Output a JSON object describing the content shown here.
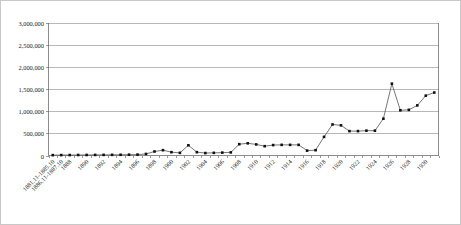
{
  "chart_data": {
    "type": "line",
    "title": "",
    "subtitle": "",
    "xlabel": "",
    "ylabel": "",
    "ylim": [
      0,
      3000000
    ],
    "ytick_labels": [
      "3,000,000",
      "2,500,000",
      "2,000,000",
      "1,500,000",
      "1,000,000",
      "500,000",
      "0"
    ],
    "ytick_values": [
      3000000,
      2500000,
      2000000,
      1500000,
      1000000,
      500000,
      0
    ],
    "grid": "horizontal",
    "legend": "none",
    "markers": "filled-square",
    "categories": [
      "1881.11-1885.10",
      "1886.11-1887.10",
      "1888",
      "1889",
      "1890",
      "1891",
      "1892",
      "1893",
      "1894",
      "1895",
      "1896",
      "1897",
      "1898",
      "1899",
      "1900",
      "1901",
      "1902",
      "1903",
      "1904",
      "1905",
      "1906",
      "1907",
      "1908",
      "1909",
      "1910",
      "1911",
      "1912",
      "1913",
      "1914",
      "1915",
      "1916",
      "1917",
      "1918",
      "1919",
      "1920",
      "1921",
      "1922",
      "1923",
      "1924",
      "1925",
      "1926",
      "1927",
      "1928",
      "1929",
      "1930",
      "1931"
    ],
    "xtick_labels_shown": [
      "1881.11-1885.10",
      "1886.11-1887.10",
      "1888",
      "1890",
      "1892",
      "1894",
      "1896",
      "1898",
      "1900",
      "1902",
      "1904",
      "1906",
      "1908",
      "1910",
      "1912",
      "1914",
      "1916",
      "1918",
      "1920",
      "1922",
      "1924",
      "1926",
      "1928",
      "1930"
    ],
    "values": [
      8000,
      9000,
      10000,
      11000,
      12000,
      13000,
      14000,
      15000,
      16000,
      18000,
      20000,
      35000,
      90000,
      120000,
      75000,
      60000,
      230000,
      75000,
      55000,
      60000,
      65000,
      70000,
      255000,
      275000,
      250000,
      210000,
      235000,
      240000,
      240000,
      240000,
      110000,
      120000,
      420000,
      700000,
      680000,
      550000,
      550000,
      560000,
      560000,
      830000,
      1620000,
      1020000,
      1030000,
      1130000,
      1350000,
      1420000
    ],
    "annotations": {
      "peak_value": 2700000,
      "peak_category": "1930",
      "final_value": 1550000
    }
  },
  "style": {
    "line_color": "#4a4a4a",
    "marker_color": "#111111",
    "gridline_color": "#9a9a9a",
    "axis_color": "#6f6f6f",
    "plot_background": "#ffffff",
    "frame_border": "#c8c8c8"
  }
}
